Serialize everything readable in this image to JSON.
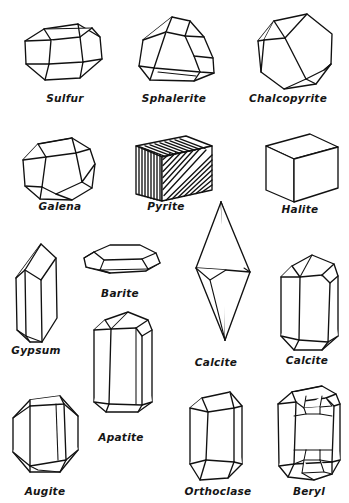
{
  "page": {
    "background_color": "#ffffff",
    "ink_color": "#111111",
    "width": 349,
    "height": 503,
    "style": "hand-drawn line illustration plate"
  },
  "figures": [
    {
      "id": "sulfur",
      "label": "Sulfur",
      "form": "orthorhombic dipyramid, barrel-like hexagonal outline",
      "label_x": 65,
      "label_y": 93,
      "fig_x": 18,
      "fig_y": 12
    },
    {
      "id": "sphalerite",
      "label": "Sphalerite",
      "form": "tetrahedron with beveled edges",
      "label_x": 174,
      "label_y": 93,
      "fig_x": 128,
      "fig_y": 10
    },
    {
      "id": "chalcopyrite",
      "label": "Chalcopyrite",
      "form": "sphenoid, tetragonal",
      "label_x": 288,
      "label_y": 93,
      "fig_x": 244,
      "fig_y": 8
    },
    {
      "id": "galena",
      "label": "Galena",
      "form": "cube with truncated octahedral corners",
      "label_x": 60,
      "label_y": 201,
      "fig_x": 14,
      "fig_y": 128
    },
    {
      "id": "pyrite",
      "label": "Pyrite",
      "form": "striated cube",
      "label_x": 166,
      "label_y": 201,
      "fig_x": 128,
      "fig_y": 128
    },
    {
      "id": "halite",
      "label": "Halite",
      "form": "cube",
      "label_x": 292,
      "label_y": 204,
      "fig_x": 258,
      "fig_y": 126
    },
    {
      "id": "gypsum",
      "label": "Gypsum",
      "form": "tabular monoclinic blade with chisel termination",
      "label_x": 29,
      "label_y": 345,
      "fig_x": 4,
      "fig_y": 238
    },
    {
      "id": "barite",
      "label": "Barite",
      "form": "tabular orthorhombic plate",
      "label_x": 118,
      "label_y": 288,
      "fig_x": 74,
      "fig_y": 240
    },
    {
      "id": "apatite",
      "label": "Apatite",
      "form": "hexagonal prism with beveled terminations",
      "label_x": 120,
      "label_y": 432,
      "fig_x": 80,
      "fig_y": 306
    },
    {
      "id": "calcite-scalenohedron",
      "label": "Calcite",
      "form": "scalenohedron, double-terminated dogtooth",
      "label_x": 215,
      "label_y": 357,
      "fig_x": 186,
      "fig_y": 198
    },
    {
      "id": "calcite-prism",
      "label": "Calcite",
      "form": "hexagonal prism with rhombohedral termination",
      "label_x": 305,
      "label_y": 355,
      "fig_x": 270,
      "fig_y": 250
    },
    {
      "id": "augite",
      "label": "Augite",
      "form": "stubby monoclinic prism, hexagonal outline",
      "label_x": 44,
      "label_y": 486,
      "fig_x": 8,
      "fig_y": 388
    },
    {
      "id": "orthoclase",
      "label": "Orthoclase",
      "form": "elongated monoclinic prism",
      "label_x": 215,
      "label_y": 486,
      "fig_x": 180,
      "fig_y": 386
    },
    {
      "id": "beryl",
      "label": "Beryl",
      "form": "hexagonal prism with complex beveled terminations",
      "label_x": 308,
      "label_y": 486,
      "fig_x": 270,
      "fig_y": 380
    }
  ]
}
